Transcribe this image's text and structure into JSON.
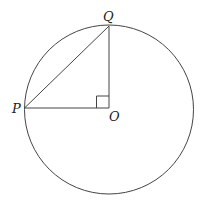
{
  "diagram": {
    "type": "geometry",
    "labels": {
      "P": "P",
      "Q": "Q",
      "O": "O"
    },
    "colors": {
      "stroke": "#444444",
      "text": "#222222",
      "background": "#ffffff"
    }
  }
}
